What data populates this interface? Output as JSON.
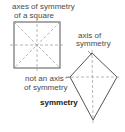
{
  "labels": {
    "square_line1": "axes of symmetry",
    "square_line2": "of a square",
    "kite_axis_line1": "axis of",
    "kite_axis_line2": "symmetry",
    "not_axis_line1": "not an axis",
    "not_axis_line2": "of symmetry",
    "title": "symmetry"
  },
  "colors": {
    "line": "#555555",
    "dash": "#999999",
    "text": "#4a4a4a"
  }
}
